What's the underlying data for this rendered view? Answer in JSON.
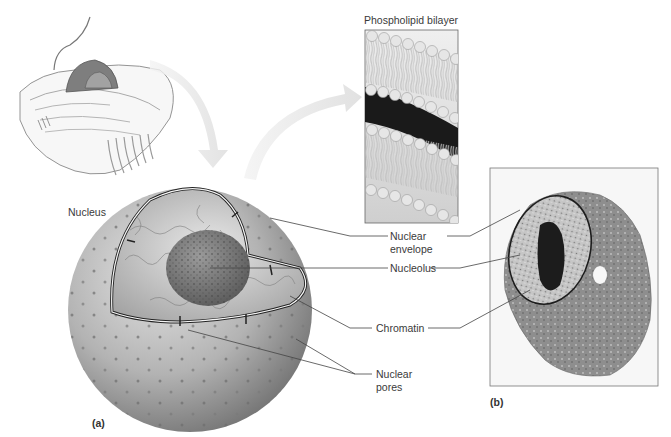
{
  "figure": {
    "panels": [
      {
        "id": "a",
        "label": "(a)"
      },
      {
        "id": "b",
        "label": "(b)"
      }
    ],
    "titles": {
      "nucleus": "Nucleus",
      "bilayer": "Phospholipid bilayer"
    },
    "callouts": [
      {
        "id": "nuclear-envelope",
        "text": "Nuclear\nenvelope"
      },
      {
        "id": "nucleolus",
        "text": "Nucleolus"
      },
      {
        "id": "chromatin",
        "text": "Chromatin"
      },
      {
        "id": "nuclear-pores",
        "text": "Nuclear\npores"
      }
    ],
    "colors": {
      "background": "#ffffff",
      "leader_line": "#444444",
      "arrow": "#e4e4e4",
      "sphere_dark": "#6f6f6f",
      "sphere_light": "#d9d9d9",
      "micrograph_bg": "#f6f6f6",
      "cell_gray": "#8a8a8a"
    }
  }
}
